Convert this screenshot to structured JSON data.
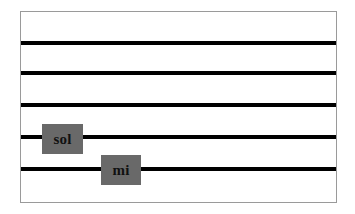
{
  "figure": {
    "kind": "music-staff-diagram",
    "width": 355,
    "height": 214,
    "background_color": "#ffffff"
  },
  "frame": {
    "border_color": "#9a9a9a",
    "fill_color": "#ffffff",
    "x": 20,
    "y": 11,
    "width": 317,
    "height": 192
  },
  "staff": {
    "line_color": "#000000",
    "line_thickness": 4,
    "line_count": 5,
    "lines": [
      {
        "index": 1,
        "name": "staff-line-1",
        "y": 41
      },
      {
        "index": 2,
        "name": "staff-line-2",
        "y": 71
      },
      {
        "index": 3,
        "name": "staff-line-3",
        "y": 103
      },
      {
        "index": 4,
        "name": "staff-line-4",
        "y": 135
      },
      {
        "index": 5,
        "name": "staff-line-5",
        "y": 167
      }
    ]
  },
  "labels": [
    {
      "id": "sol",
      "text": "sol",
      "box_color": "#696969",
      "text_color": "#111111",
      "x": 21,
      "y": 112,
      "width": 41,
      "height": 30,
      "on_line": 4
    },
    {
      "id": "mi",
      "text": "mi",
      "box_color": "#696969",
      "text_color": "#111111",
      "x": 80,
      "y": 143,
      "width": 40,
      "height": 30,
      "on_line": 5
    }
  ]
}
